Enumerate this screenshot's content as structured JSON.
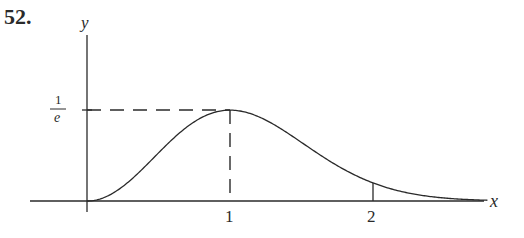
{
  "problem_number": "52.",
  "chart_data": {
    "type": "line",
    "title": "",
    "xlabel": "x",
    "ylabel": "y",
    "function": "y = x^2 e^{-x^2}",
    "x_ticks": [
      {
        "value": 1,
        "label": "1"
      },
      {
        "value": 2,
        "label": "2"
      }
    ],
    "y_ticks": [
      {
        "value": 0.3679,
        "label_numerator": "1",
        "label_denominator": "e"
      }
    ],
    "xlim": [
      0,
      2.8
    ],
    "ylim": [
      0,
      0.68
    ],
    "annotations": [
      {
        "type": "dashed-horizontal",
        "y": 0.3679,
        "from_x": 0,
        "to_x": 1
      },
      {
        "type": "dashed-vertical",
        "x": 1,
        "from_y": 0,
        "to_y": 0.3679
      },
      {
        "type": "solid-vertical",
        "x": 2,
        "from_y": 0,
        "to_y": 0.0733
      }
    ],
    "points": [
      {
        "x": 0,
        "y": 0
      },
      {
        "x": 0.5,
        "y": 0.1947
      },
      {
        "x": 1,
        "y": 0.3679
      },
      {
        "x": 1.5,
        "y": 0.2371
      },
      {
        "x": 2,
        "y": 0.0733
      },
      {
        "x": 2.5,
        "y": 0.0121
      },
      {
        "x": 2.8,
        "y": 0.0031
      }
    ],
    "grid": false,
    "legend": null
  },
  "colors": {
    "ink": "#2a2a2a",
    "background": "#ffffff"
  }
}
